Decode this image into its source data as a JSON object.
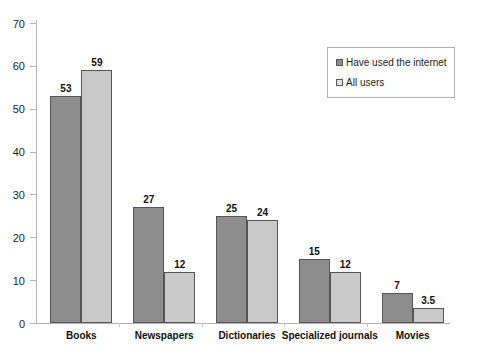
{
  "chart_data": {
    "type": "bar",
    "title": "",
    "subtitle": "",
    "xlabel": "",
    "ylabel": "",
    "ylim": [
      0,
      70
    ],
    "yticks": [
      0,
      10,
      20,
      30,
      40,
      50,
      60,
      70
    ],
    "ytick_labels": [
      "0",
      "10",
      "20",
      "30",
      "40",
      "50",
      "60",
      "70"
    ],
    "grid": false,
    "legend_position": "top-right",
    "categories": [
      "Books",
      "Newspapers",
      "Dictionaries",
      "Specialized journals",
      "Movies"
    ],
    "series": [
      {
        "name": "Have used the internet",
        "color": "#8d8d8d",
        "values": [
          53,
          27,
          25,
          15,
          7
        ],
        "value_labels": [
          "53",
          "27",
          "25",
          "15",
          "7"
        ]
      },
      {
        "name": "All users",
        "color": "#c9c9c9",
        "values": [
          59,
          12,
          24,
          12,
          3.5
        ],
        "value_labels": [
          "59",
          "12",
          "24",
          "12",
          "3.5"
        ]
      }
    ]
  },
  "legend": {
    "items": [
      {
        "label": "Have used the internet"
      },
      {
        "label": "All users"
      }
    ]
  },
  "colors": {
    "series_1": "#8d8d8d",
    "series_2": "#c9c9c9",
    "axis": "#b4b4b4",
    "text": "#1a1a1a",
    "background": "#ffffff"
  }
}
